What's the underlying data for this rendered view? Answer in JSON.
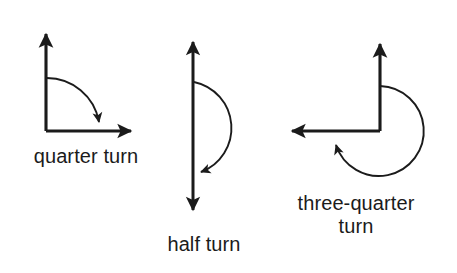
{
  "figure": {
    "background_color": "#ffffff",
    "stroke_color": "#1b1b1b",
    "width": 457,
    "height": 273,
    "items": [
      {
        "id": "quarter-turn",
        "label": "quarter turn",
        "description": "Right angle formed by an upward ray and a rightward ray, with a clockwise quarter-circle arc from the vertical ray to the horizontal ray.",
        "turn_fraction": "1/4",
        "degrees": 90,
        "direction": "clockwise",
        "rays": [
          "up",
          "right"
        ],
        "vertex": [
          46,
          131
        ],
        "arc_radius": 54
      },
      {
        "id": "half-turn",
        "label": "half turn",
        "description": "A vertical double-headed arrow with a clockwise semicircular arc bulging to the right, from the upper part of the line to the lower part.",
        "turn_fraction": "1/2",
        "degrees": 180,
        "direction": "clockwise",
        "rays": [
          "up",
          "down"
        ],
        "vertex": [
          193,
          129
        ],
        "arc_radius": 47
      },
      {
        "id": "three-quarter-turn",
        "label": "three-quarter\nturn",
        "label_line_1": "three-quarter",
        "label_line_2": "turn",
        "description": "Right angle formed by an upward ray and a leftward ray, with a clockwise three-quarter circle arc from the vertical ray around to the horizontal ray.",
        "turn_fraction": "3/4",
        "degrees": 270,
        "direction": "clockwise",
        "rays": [
          "up",
          "left"
        ],
        "vertex": [
          380,
          131
        ],
        "arc_radius": 45
      }
    ]
  }
}
